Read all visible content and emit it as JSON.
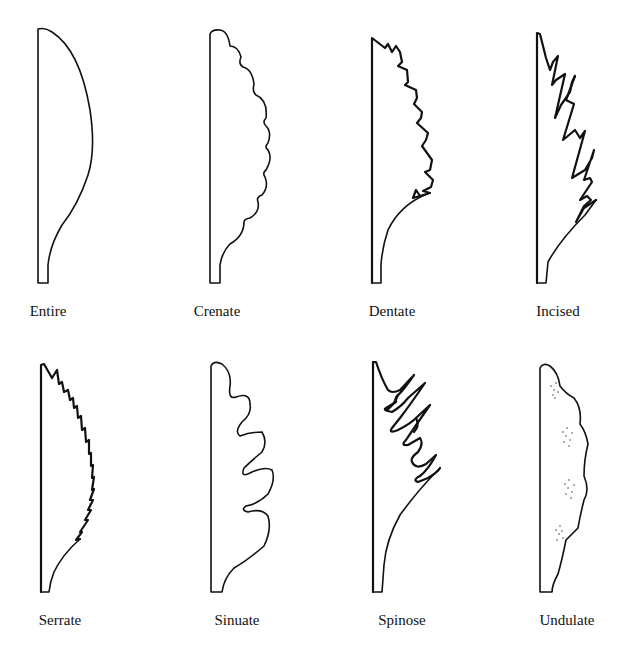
{
  "figure": {
    "items": [
      {
        "label": "Entire",
        "row": 1,
        "col": 1
      },
      {
        "label": "Crenate",
        "row": 1,
        "col": 2
      },
      {
        "label": "Dentate",
        "row": 1,
        "col": 3
      },
      {
        "label": "Incised",
        "row": 1,
        "col": 4
      },
      {
        "label": "Serrate",
        "row": 2,
        "col": 1
      },
      {
        "label": "Sinuate",
        "row": 2,
        "col": 2
      },
      {
        "label": "Spinose",
        "row": 2,
        "col": 3
      },
      {
        "label": "Undulate",
        "row": 2,
        "col": 4
      }
    ]
  }
}
